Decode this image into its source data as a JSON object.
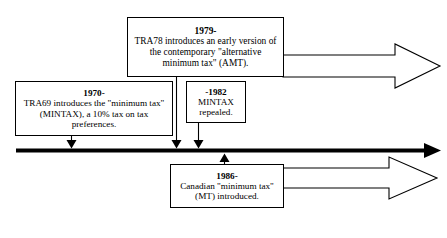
{
  "diagram": {
    "type": "timeline",
    "line_color": "#000000",
    "box_border_color": "#000000",
    "background": "#ffffff"
  },
  "events": [
    {
      "id": "1979",
      "year": "1979-",
      "description": "TRA78 introduces an early version of the contemporary \"alternative minimum tax\" (AMT).",
      "position": "above-line",
      "connector": "down-arrow"
    },
    {
      "id": "1970",
      "year": "1970-",
      "description": "TRA69 introduces the \"minimum tax\" (MINTAX), a 10% tax on tax preferences.",
      "position": "above-line",
      "connector": "down-arrow"
    },
    {
      "id": "1982",
      "year": "-1982",
      "description": "MINTAX repealed.",
      "position": "above-line",
      "connector": "down-arrow"
    },
    {
      "id": "1986",
      "year": "1986-",
      "description": "Canadian \"minimum tax\" (MT) introduced.",
      "position": "below-line",
      "connector": "up-arrow"
    }
  ],
  "block_arrows": [
    {
      "id": "amt-continues",
      "from_event": "1979",
      "direction": "right",
      "label": ""
    },
    {
      "id": "mt-continues",
      "from_event": "1986",
      "direction": "right",
      "label": ""
    }
  ]
}
